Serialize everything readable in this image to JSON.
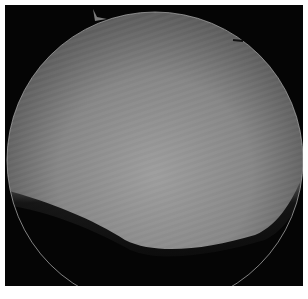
{
  "image": {
    "description": "Grayscale circular endoscopic/microscopic field of view with a dark shadowed lower region",
    "colors": {
      "background": "#050505",
      "field_light": "#9a9a9a",
      "field_mid": "#7a7a7a",
      "field_dark": "#4a4a4a",
      "rim": "#b0b0b0"
    }
  },
  "caption": {
    "text": ""
  }
}
